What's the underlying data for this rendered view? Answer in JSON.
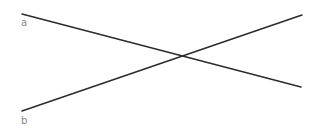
{
  "diagram": {
    "width": 318,
    "height": 137,
    "stroke_color": "#2b2b2b",
    "label_color": "#8a8a8a",
    "lines": [
      {
        "id": "a",
        "label": "a",
        "x1": 22,
        "y1": 14,
        "x2": 301,
        "y2": 87,
        "label_x": 21,
        "label_y": 18
      },
      {
        "id": "b",
        "label": "b",
        "x1": 22,
        "y1": 111,
        "x2": 302,
        "y2": 15,
        "label_x": 21,
        "label_y": 116
      }
    ],
    "intersection": {
      "x": 183,
      "y": 56
    }
  }
}
